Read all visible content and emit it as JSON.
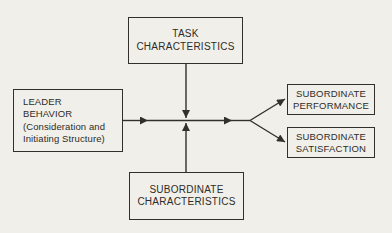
{
  "colors": {
    "ink": "#32302c",
    "paper": "#f1efe9"
  },
  "diagram": {
    "type": "flow-diagram",
    "nodes": {
      "task_characteristics": {
        "lines": [
          "TASK",
          "CHARACTERISTICS"
        ]
      },
      "leader_behavior": {
        "lines": [
          "LEADER",
          "BEHAVIOR",
          "(Consideration and",
          "Initiating Structure)"
        ]
      },
      "subordinate_characteristics": {
        "lines": [
          "SUBORDINATE",
          "CHARACTERISTICS"
        ]
      },
      "subordinate_performance": {
        "lines": [
          "SUBORDINATE",
          "PERFORMANCE"
        ]
      },
      "subordinate_satisfaction": {
        "lines": [
          "SUBORDINATE",
          "SATISFACTION"
        ]
      }
    },
    "edges": [
      {
        "from": "leader_behavior",
        "to": "central_junction",
        "direction": "right"
      },
      {
        "from": "task_characteristics",
        "to": "central_junction",
        "direction": "down"
      },
      {
        "from": "subordinate_characteristics",
        "to": "central_junction",
        "direction": "up"
      },
      {
        "from": "central_junction",
        "to": "subordinate_performance",
        "direction": "up-right"
      },
      {
        "from": "central_junction",
        "to": "subordinate_satisfaction",
        "direction": "down-right"
      }
    ]
  }
}
